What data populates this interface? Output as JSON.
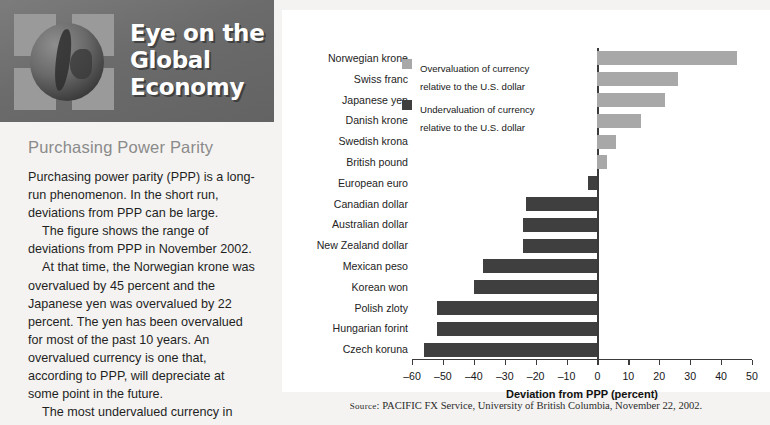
{
  "masthead": {
    "title": "Eye on the Global Economy",
    "logo_icon": "globe-icon"
  },
  "article": {
    "section_title": "Purchasing Power Parity",
    "paragraphs": [
      "Purchasing power parity (PPP) is a long-run phenomenon. In the short run, deviations from PPP can be large.",
      "The figure shows the range of deviations from PPP in November 2002.",
      "At that time, the Norwegian krone was overvalued by 45 percent and the Japanese yen was overvalued by 22 percent. The yen has been overvalued for most of the past 10 years. An overvalued currency is one that, according to PPP, will depreciate at some point in the future.",
      "The most undervalued currency in"
    ]
  },
  "source": {
    "prefix": "Source",
    "text": ": PACIFIC FX Service, University of British Columbia, November 22, 2002."
  },
  "colors": {
    "overvaluation": "#a8a8a8",
    "undervaluation": "#3f3f3f",
    "masthead_bg": "#6f6f6f",
    "section_title": "#8a8a8a",
    "axis": "#3b3b3b"
  },
  "chart_data": {
    "type": "bar",
    "orientation": "horizontal",
    "title": "",
    "xlabel": "Deviation from PPP (percent)",
    "ylabel": "",
    "xlim": [
      -60,
      50
    ],
    "grid": false,
    "legend_position": "top-left-inside",
    "ticks": [
      -60,
      -50,
      -40,
      -30,
      -20,
      -10,
      0,
      10,
      20,
      30,
      40,
      50
    ],
    "tick_labels": [
      "–60",
      "–50",
      "–40",
      "–30",
      "–20",
      "–10",
      "0",
      "10",
      "20",
      "30",
      "40",
      "50"
    ],
    "legend": [
      {
        "label": "Overvaluation of currency relative to the U.S. dollar",
        "color": "#a8a8a8",
        "key": "over"
      },
      {
        "label": "Undervaluation of currency relative to the U.S. dollar",
        "color": "#3f3f3f",
        "key": "under"
      }
    ],
    "categories": [
      "Norwegian krone",
      "Swiss franc",
      "Japanese yen",
      "Danish krone",
      "Swedish krona",
      "British pound",
      "European euro",
      "Canadian dollar",
      "Australian dollar",
      "New Zealand dollar",
      "Mexican peso",
      "Korean won",
      "Polish zloty",
      "Hungarian forint",
      "Czech koruna"
    ],
    "values": [
      45,
      26,
      22,
      14,
      6,
      3,
      -3,
      -23,
      -24,
      -24,
      -37,
      -40,
      -52,
      -52,
      -56
    ]
  }
}
